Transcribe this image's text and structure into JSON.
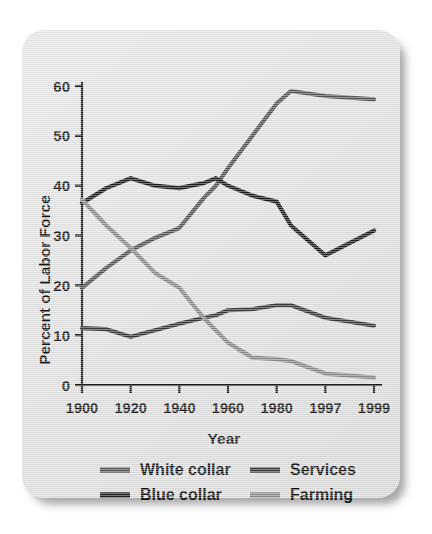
{
  "figure": {
    "background_color": "#e4e4e4",
    "card_shadow": true
  },
  "axes": {
    "y_title": "Percent of Labor Force",
    "x_title": "Year",
    "y_ticks": [
      "0",
      "10",
      "20",
      "30",
      "40",
      "50",
      "60"
    ],
    "x_ticks": [
      "1900",
      "1920",
      "1940",
      "1960",
      "1980",
      "1997",
      "1999"
    ]
  },
  "legend": {
    "entries": [
      {
        "label": "White collar",
        "color": "#555555",
        "swatch": "line-swatch"
      },
      {
        "label": "Services",
        "color": "#3a3a3a",
        "swatch": "line-swatch"
      },
      {
        "label": "Blue collar",
        "color": "#1e1e1e",
        "swatch": "line-swatch"
      },
      {
        "label": "Farming",
        "color": "#8a8a8a",
        "swatch": "line-swatch"
      }
    ]
  },
  "chart_data": {
    "type": "line",
    "title": "",
    "xlabel": "Year",
    "ylabel": "Percent of Labor Force",
    "xlim": [
      1900,
      1999
    ],
    "ylim": [
      0,
      60
    ],
    "ytick_values": [
      0,
      10,
      20,
      30,
      40,
      50,
      60
    ],
    "xtick_values": [
      1900,
      1920,
      1940,
      1960,
      1980,
      1997,
      1999
    ],
    "xtick_labels": [
      "1900",
      "1920",
      "1940",
      "1960",
      "1980",
      "1997",
      "1999"
    ],
    "grid": false,
    "legend_position": "bottom",
    "x": [
      1900,
      1910,
      1920,
      1930,
      1940,
      1950,
      1955,
      1960,
      1970,
      1980,
      1985,
      1997,
      1999
    ],
    "series": [
      {
        "name": "White collar",
        "color": "#555555",
        "values": [
          19.5,
          23.5,
          27.0,
          29.5,
          31.5,
          37.5,
          40.0,
          43.5,
          50.0,
          56.5,
          59.0,
          58.0,
          57.3
        ]
      },
      {
        "name": "Blue collar",
        "color": "#1e1e1e",
        "values": [
          36.5,
          39.5,
          41.5,
          40.0,
          39.5,
          40.5,
          41.5,
          40.0,
          38.0,
          36.8,
          32.0,
          26.0,
          31.0
        ]
      },
      {
        "name": "Services",
        "color": "#3a3a3a",
        "values": [
          11.4,
          11.2,
          9.7,
          11.0,
          12.3,
          13.5,
          14.0,
          15.0,
          15.2,
          16.0,
          16.0,
          13.5,
          11.9
        ]
      },
      {
        "name": "Farming",
        "color": "#8a8a8a",
        "values": [
          37.2,
          32.0,
          27.5,
          22.5,
          19.5,
          13.5,
          11.0,
          8.5,
          5.5,
          5.2,
          4.8,
          2.3,
          1.5
        ]
      }
    ]
  }
}
